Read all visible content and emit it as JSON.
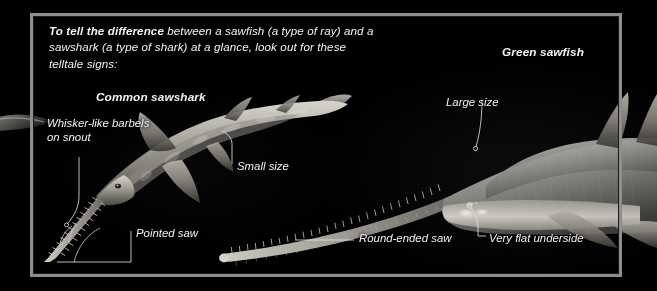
{
  "figure": {
    "kind": "comparison-infographic",
    "background_color": "#000000",
    "frame_color": "#8e8e8e",
    "text_color": "#f2f2f2"
  },
  "headline": {
    "lead": "To tell the difference",
    "rest": " between a sawfish (a type of ray) and a sawshark (a type of shark) at a glance, look out for these telltale signs:"
  },
  "specimens": [
    {
      "id": "common-sawshark",
      "label": "Common sawshark"
    },
    {
      "id": "green-sawfish",
      "label": "Green sawfish"
    }
  ],
  "callouts": [
    {
      "id": "whisker",
      "label": "Whisker-like barbels on snout",
      "target": "common-sawshark"
    },
    {
      "id": "small-size",
      "label": "Small size",
      "target": "common-sawshark"
    },
    {
      "id": "pointed-saw",
      "label": "Pointed saw",
      "target": "common-sawshark"
    },
    {
      "id": "large-size",
      "label": "Large size",
      "target": "green-sawfish"
    },
    {
      "id": "round-ended",
      "label": "Round-ended saw",
      "target": "green-sawfish"
    },
    {
      "id": "very-flat",
      "label": "Very flat underside",
      "target": "green-sawfish"
    }
  ]
}
